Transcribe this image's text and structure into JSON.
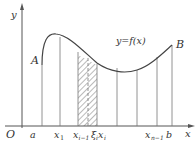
{
  "figure": {
    "type": "riemann-sum-diagram",
    "axes": {
      "x_label": "x",
      "y_label": "y",
      "origin_label": "O"
    },
    "curve": {
      "label": "y=f(x)",
      "start_point_label": "A",
      "end_point_label": "B"
    },
    "partition_labels": {
      "a": "a",
      "x1": "x",
      "x1_sub": "1",
      "xi_minus_1": "x",
      "xi_minus_1_sub": "i−1",
      "xi_point": "ξ",
      "xi_point_sub": "i",
      "xi": "x",
      "xi_sub": "i",
      "xn_minus_1": "x",
      "xn_minus_1_sub": "n−1",
      "b": "b"
    },
    "colors": {
      "line": "#555555",
      "text": "#333333",
      "hatch": "#666666",
      "background": "#ffffff"
    }
  }
}
